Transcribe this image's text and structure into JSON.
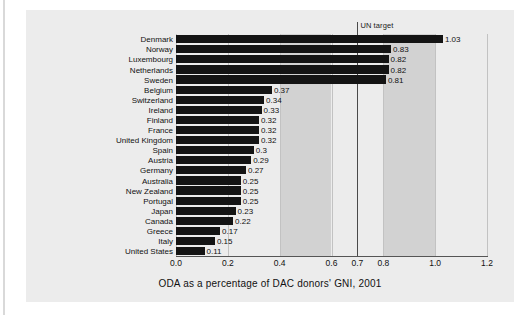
{
  "caption": "ODA as a percentage of DAC donors' GNI, 2001",
  "annotation": {
    "un_target_label": "UN target",
    "un_target_value": 0.7
  },
  "colors": {
    "page_background": "#ffffff",
    "panel_background": "#ececec",
    "band_shade": "#d2d2d2",
    "bar": "#141414",
    "gridline": "#c2c2c2",
    "target_line": "#4a4a4a",
    "text": "#111111"
  },
  "axis": {
    "ticks": [
      "0.0",
      "0.2",
      "0.4",
      "0.6",
      "0.7",
      "0.8",
      "1.0",
      "1.2"
    ],
    "tick_values": [
      0.0,
      0.2,
      0.4,
      0.6,
      0.7,
      0.8,
      1.0,
      1.2
    ],
    "min": 0.0,
    "max": 1.2
  },
  "shaded_bands": [
    [
      0.4,
      0.6
    ],
    [
      0.8,
      1.0
    ]
  ],
  "chart_data": {
    "type": "bar",
    "orientation": "horizontal",
    "title": "",
    "xlabel": "ODA as a percentage of DAC donors' GNI, 2001",
    "ylabel": "",
    "xlim": [
      0.0,
      1.2
    ],
    "grid": true,
    "legend": "none",
    "categories": [
      "Denmark",
      "Norway",
      "Luxembourg",
      "Netherlands",
      "Sweden",
      "Belgium",
      "Switzerland",
      "Ireland",
      "Finland",
      "France",
      "United Kingdom",
      "Spain",
      "Austria",
      "Germany",
      "Australia",
      "New Zealand",
      "Portugal",
      "Japan",
      "Canada",
      "Greece",
      "Italy",
      "United States"
    ],
    "values": [
      1.03,
      0.83,
      0.82,
      0.82,
      0.81,
      0.37,
      0.34,
      0.33,
      0.32,
      0.32,
      0.32,
      0.3,
      0.29,
      0.27,
      0.25,
      0.25,
      0.25,
      0.23,
      0.22,
      0.17,
      0.15,
      0.11
    ],
    "value_labels": [
      "1.03",
      "0.83",
      "0.82",
      "0.82",
      "0.81",
      "0.37",
      "0.34",
      "0.33",
      "0.32",
      "0.32",
      "0.32",
      "0.3",
      "0.29",
      "0.27",
      "0.25",
      "0.25",
      "0.25",
      "0.23",
      "0.22",
      "0.17",
      "0.15",
      "0.11"
    ],
    "annotations": [
      {
        "label": "UN target",
        "x": 0.7,
        "type": "vline"
      }
    ]
  }
}
